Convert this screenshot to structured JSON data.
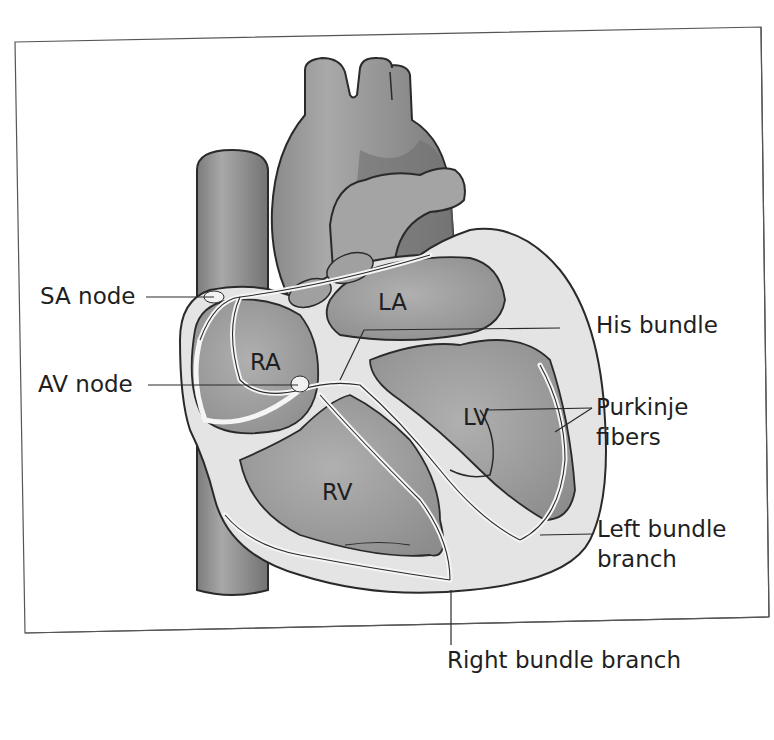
{
  "diagram": {
    "type": "anatomical-illustration",
    "chambers": [
      {
        "id": "RA",
        "label": "RA"
      },
      {
        "id": "LA",
        "label": "LA"
      },
      {
        "id": "RV",
        "label": "RV"
      },
      {
        "id": "LV",
        "label": "LV"
      }
    ],
    "callouts": {
      "sa_node": "SA node",
      "av_node": "AV node",
      "his_bundle": "His bundle",
      "purkinje_line1": "Purkinje",
      "purkinje_line2": "fibers",
      "left_bundle_line1": "Left bundle",
      "left_bundle_line2": "branch",
      "right_bundle": "Right bundle branch"
    },
    "colors": {
      "frame": "#555555",
      "vessel_dark": "#7a7a7a",
      "vessel_mid": "#8e8e8e",
      "chamber": "#9c9c9c",
      "myocardium": "#e6e6e6",
      "outline": "#2a2a2a",
      "text": "#1f1f1f"
    }
  }
}
